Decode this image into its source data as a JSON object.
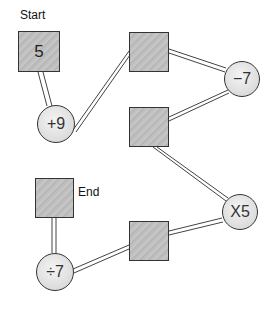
{
  "labels": {
    "start": "Start",
    "end": "End"
  },
  "nodes": {
    "start_box": {
      "value": "5"
    },
    "op1": {
      "value": "+9"
    },
    "box2": {
      "value": ""
    },
    "op2": {
      "value": "−7"
    },
    "box3": {
      "value": ""
    },
    "op3": {
      "value": "X5"
    },
    "box4": {
      "value": ""
    },
    "op4": {
      "value": "÷7"
    },
    "end_box": {
      "value": ""
    }
  },
  "colors": {
    "box_fill": "#c2c2c2",
    "circle_fill": "#e4e4e4",
    "stroke": "#333333"
  }
}
